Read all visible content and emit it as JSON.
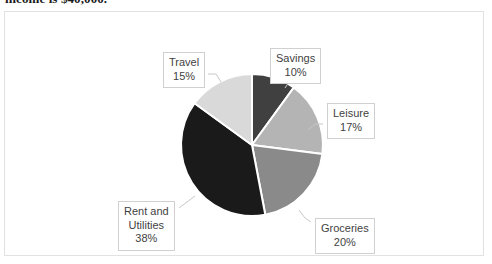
{
  "heading": {
    "text": "income is $40,000."
  },
  "chart_data": {
    "type": "pie",
    "title": "",
    "xlabel": "",
    "ylabel": "",
    "legend_position": "none",
    "labels_style": "callout-boxes-with-leader-lines",
    "total_percent": 100,
    "categories": [
      "Savings",
      "Leisure",
      "Groceries",
      "Rent and Utilities",
      "Travel"
    ],
    "values": [
      10,
      17,
      20,
      38,
      15
    ],
    "value_unit": "%",
    "start_angle_deg": 0,
    "direction": "clockwise",
    "slices": [
      {
        "name": "Savings",
        "label_line1": "Savings",
        "label_line2": "10%",
        "value": 10,
        "color": "#404040",
        "start_angle_deg": 0,
        "end_angle_deg": 36
      },
      {
        "name": "Leisure",
        "label_line1": "Leisure",
        "label_line2": "17%",
        "value": 17,
        "color": "#b4b4b4",
        "start_angle_deg": 36,
        "end_angle_deg": 97.2
      },
      {
        "name": "Groceries",
        "label_line1": "Groceries",
        "label_line2": "20%",
        "value": 20,
        "color": "#8a8a8a",
        "start_angle_deg": 97.2,
        "end_angle_deg": 169.2
      },
      {
        "name": "Rent and Utilities",
        "label_line1": "Rent and",
        "label_line2": "Utilities",
        "label_line3": "38%",
        "value": 38,
        "color": "#1a1a1a",
        "start_angle_deg": 169.2,
        "end_angle_deg": 306
      },
      {
        "name": "Travel",
        "label_line1": "Travel",
        "label_line2": "15%",
        "value": 15,
        "color": "#d9d9d9",
        "start_angle_deg": 306,
        "end_angle_deg": 360
      }
    ],
    "slice_separator_color": "#ffffff",
    "plot_background": "#ffffff",
    "frame_border_color": "#e2e2e2"
  }
}
